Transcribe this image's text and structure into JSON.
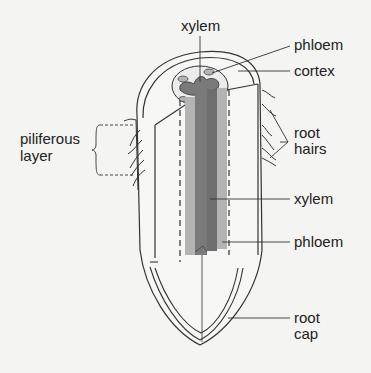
{
  "diagram": {
    "labels": {
      "xylem_top": "xylem",
      "phloem_top": "phloem",
      "cortex": "cortex",
      "piliferous_line1": "piliferous",
      "piliferous_line2": "layer",
      "root_hairs_line1": "root",
      "root_hairs_line2": "hairs",
      "xylem_side": "xylem",
      "phloem_side": "phloem",
      "root_cap_line1": "root",
      "root_cap_line2": "cap"
    },
    "colors": {
      "background": "#f4f4f2",
      "outline": "#333333",
      "xylem": "#7a7a7a",
      "phloem": "#b4b4b4",
      "stele_light": "#d8d8d8"
    }
  }
}
